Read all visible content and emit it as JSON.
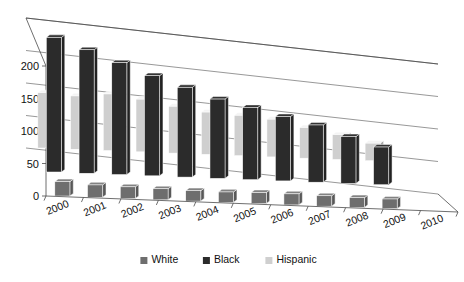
{
  "chart_data": {
    "type": "bar",
    "title": "",
    "subtitle": "",
    "xlabel": "",
    "ylabel": "",
    "ylim": [
      0,
      200
    ],
    "yticks": [
      0,
      50,
      100,
      150,
      200
    ],
    "ytick_labels": [
      "0",
      "50",
      "100",
      "150",
      "200"
    ],
    "grid": true,
    "three_d": true,
    "legend_position": "bottom",
    "categories": [
      "2000",
      "2001",
      "2002",
      "2003",
      "2004",
      "2005",
      "2006",
      "2007",
      "2008",
      "2009",
      "2010"
    ],
    "series": [
      {
        "name": "White",
        "color": "#6e6e6e",
        "values": [
          22,
          19,
          18,
          17,
          16,
          16,
          17,
          17,
          16,
          15,
          15
        ]
      },
      {
        "name": "Black",
        "color": "#2b2b2b",
        "values": [
          207,
          190,
          172,
          154,
          138,
          122,
          111,
          99,
          88,
          72,
          58
        ]
      },
      {
        "name": "Hispanic",
        "color": "#cfcfcf",
        "values": [
          85,
          82,
          87,
          81,
          72,
          65,
          62,
          58,
          47,
          38,
          27
        ]
      }
    ]
  },
  "legend": {
    "items": [
      {
        "label": "White",
        "color": "#6e6e6e"
      },
      {
        "label": "Black",
        "color": "#2b2b2b"
      },
      {
        "label": "Hispanic",
        "color": "#cfcfcf"
      }
    ]
  },
  "colors": {
    "background": "#ffffff",
    "axis": "#4a4a4a",
    "grid": "#6b6b6b",
    "text": "#111111"
  }
}
